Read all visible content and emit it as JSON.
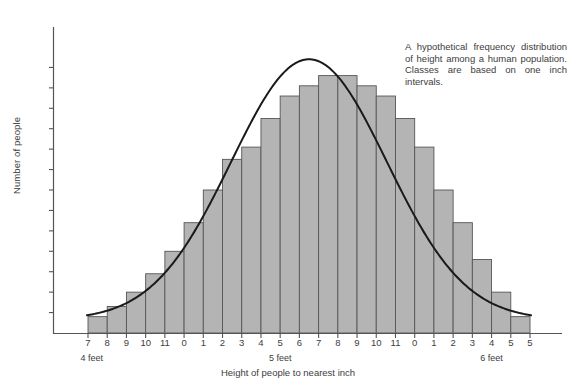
{
  "chart_data": {
    "type": "bar",
    "title": "",
    "subtitle": "",
    "xlabel": "Height of people to nearest inch",
    "ylabel": "Number of people",
    "categories": [
      "7",
      "8",
      "9",
      "10",
      "11",
      "0",
      "1",
      "2",
      "3",
      "4",
      "5",
      "6",
      "7",
      "8",
      "9",
      "10",
      "11",
      "0",
      "1",
      "2",
      "3",
      "4",
      "5"
    ],
    "values": [
      8,
      13,
      20,
      29,
      40,
      54,
      70,
      85,
      91,
      105,
      116,
      121,
      126,
      126,
      121,
      116,
      105,
      91,
      70,
      54,
      36,
      20,
      8
    ],
    "ylim": [
      0,
      140
    ],
    "yticks": [
      10,
      20,
      30,
      40,
      50,
      60,
      70,
      80,
      90,
      100,
      110,
      120,
      130
    ],
    "grid": false,
    "legend": null,
    "overlay_curve": "smooth normal distribution curve drawn through bar tops",
    "group_labels": [
      "4 feet",
      "5 feet",
      "6 feet"
    ],
    "bar_fill": "#b4b4b4",
    "bar_stroke": "#565656",
    "curve_color": "#1a1a1a",
    "axis_color": "#555555",
    "caption": "A hypothetical frequency distribution of height among a human population. Classes are based on one inch intervals."
  },
  "axis": {
    "y_title": "Number of people",
    "x_title": "Height of people to nearest inch",
    "y_tick_labels": [
      "130",
      "120",
      "110",
      "100",
      "90",
      "80",
      "70",
      "60",
      "50",
      "40",
      "30",
      "20",
      "10"
    ],
    "x_tick_labels": [
      "7",
      "8",
      "9",
      "10",
      "11",
      "0",
      "1",
      "2",
      "3",
      "4",
      "5",
      "6",
      "7",
      "8",
      "9",
      "10",
      "11",
      "0",
      "1",
      "2",
      "3",
      "4",
      "5"
    ],
    "group_labels": [
      {
        "text": "4 feet"
      },
      {
        "text": "5 feet"
      },
      {
        "text": "6 feet"
      }
    ]
  },
  "annotation": {
    "caption": "A hypothetical frequency distribution of height among a human population. Classes are based on one inch intervals."
  }
}
